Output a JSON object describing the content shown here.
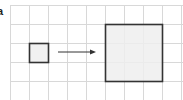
{
  "figure": {
    "panel_label": "a",
    "grid": {
      "origin_x": 10,
      "origin_y": 5,
      "cell_size": 19,
      "cols": 9,
      "rows": 5,
      "line_color": "#d8d8d8"
    },
    "small_square": {
      "col": 1,
      "row": 2,
      "size_cells": 1,
      "fill": "#eeeeee",
      "stroke": "#333333"
    },
    "large_square": {
      "col": 5,
      "row": 1,
      "size_cells": 3,
      "fill": "#eeeeee",
      "stroke": "#333333"
    },
    "arrow": {
      "x1": 58,
      "y1": 52,
      "x2": 96,
      "y2": 52,
      "color": "#333333",
      "meaning": "scale-up"
    }
  }
}
